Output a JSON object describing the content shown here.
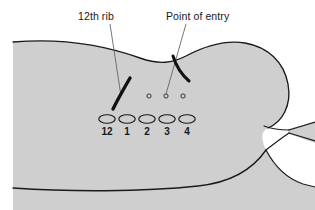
{
  "figure": {
    "background_color": "#ffffff",
    "body_fill_color": "#cfcfcf",
    "body_outline_color": "#1a1a1a",
    "mark_color": "#111111",
    "label_color": "#16181a"
  },
  "labels": {
    "rib": "12th rib",
    "entry": "Point of entry"
  },
  "vertebrae": {
    "header": "",
    "items": [
      {
        "number": "12",
        "cx": 107,
        "cy": 119
      },
      {
        "number": "1",
        "cx": 127,
        "cy": 119
      },
      {
        "number": "2",
        "cx": 147,
        "cy": 119
      },
      {
        "number": "3",
        "cx": 167,
        "cy": 119
      },
      {
        "number": "4",
        "cx": 187,
        "cy": 119
      }
    ],
    "ellipse_rx": 8.2,
    "ellipse_ry": 4.3,
    "number_y": 133
  },
  "entry_points": [
    {
      "cx": 149,
      "cy": 96,
      "r": 2.1
    },
    {
      "cx": 166,
      "cy": 96,
      "r": 2.1
    },
    {
      "cx": 183,
      "cy": 96,
      "r": 2.1
    }
  ],
  "rib_mark": {
    "name": "12th-rib-stroke",
    "path": "M 113 108 C 118 100 124 90 131 79",
    "width": 3.4
  },
  "entry_mark": {
    "name": "entry-incision-stroke",
    "path": "M 173 57 C 177 66 182 74 189 80",
    "width": 3.0
  },
  "leader_lines": [
    {
      "name": "leader-rib",
      "x1": 110,
      "y1": 23,
      "x2": 121,
      "y2": 95
    },
    {
      "name": "leader-entry",
      "x1": 186,
      "y1": 23,
      "x2": 166,
      "y2": 94
    }
  ],
  "body_outline": {
    "top_path": "M 13 42 C 60 38 104 45 140 58 C 160 65 172 63 186 56 C 205 46 226 40 245 43 C 268 47 284 62 288 84 C 292 106 282 122 268 128",
    "bottom_path": "M 13 188 C 70 192 140 192 196 186 C 224 183 250 172 266 150",
    "left_edge": "M 13 42 L 13 188",
    "cleft_upper": "M 265 126 C 274 128 282 129 288 130",
    "cleft_lower": "M 266 150 C 276 142 283 136 288 133",
    "thigh_upper": "M 288 130 L 315 124",
    "thigh_lower": "M 288 133 L 315 140",
    "right_bottom": "M 266 150 C 274 166 286 178 302 184 L 315 186"
  }
}
